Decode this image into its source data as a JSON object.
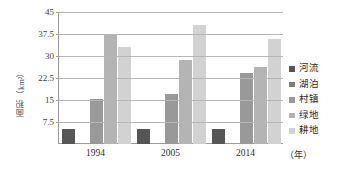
{
  "chart_data": {
    "type": "bar",
    "title": "",
    "subtitle": "",
    "xlabel": "（年）",
    "ylabel": "面积（km²）",
    "categories": [
      "1994",
      "2005",
      "2014"
    ],
    "series": [
      {
        "name": "河流",
        "color": "#565656",
        "values": [
          5.0,
          5.1,
          5.1
        ]
      },
      {
        "name": "湖泊",
        "color": "#7d7d7d",
        "values": [
          0.0,
          0.0,
          0.0
        ]
      },
      {
        "name": "村镇",
        "color": "#999999",
        "values": [
          15.2,
          17.0,
          24.3
        ]
      },
      {
        "name": "绿地",
        "color": "#b4b4b4",
        "values": [
          37.6,
          28.8,
          26.3
        ]
      },
      {
        "name": "耕地",
        "color": "#d2d2d2",
        "values": [
          33.0,
          40.5,
          35.7
        ]
      }
    ],
    "ylim": [
      0,
      45
    ],
    "yticks": [
      7.5,
      15,
      22.5,
      30,
      37.5,
      45
    ],
    "ytick_labels": [
      "7.5",
      "15",
      "22.5",
      "30",
      "37.5",
      "45"
    ],
    "grid": true,
    "legend_position": "right",
    "annotations": []
  },
  "axes": {
    "x_unit_label": "（年）",
    "y_title": "面积（km²）"
  },
  "legend": {
    "items": [
      {
        "label": "河流"
      },
      {
        "label": "湖泊"
      },
      {
        "label": "村镇"
      },
      {
        "label": "绿地"
      },
      {
        "label": "耕地"
      }
    ]
  },
  "colors": {
    "gridline": "#b6b6b6",
    "axis": "#9a9a9a",
    "background": "#ffffff",
    "text": "#2b2b2b"
  }
}
